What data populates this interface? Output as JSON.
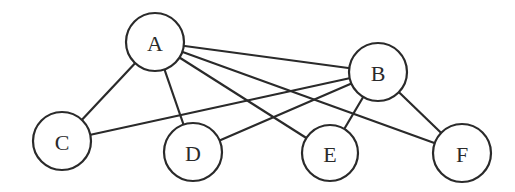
{
  "diagram": {
    "type": "bipartite-graph",
    "colors": {
      "stroke": "#2a2a2a",
      "fill": "#ffffff",
      "background": "#ffffff"
    },
    "nodes": [
      {
        "id": "A",
        "label": "A",
        "x": 155,
        "y": 42,
        "r": 29
      },
      {
        "id": "B",
        "label": "B",
        "x": 378,
        "y": 72,
        "r": 29
      },
      {
        "id": "C",
        "label": "C",
        "x": 62,
        "y": 141,
        "r": 29
      },
      {
        "id": "D",
        "label": "D",
        "x": 193,
        "y": 152,
        "r": 29
      },
      {
        "id": "E",
        "label": "E",
        "x": 330,
        "y": 153,
        "r": 28
      },
      {
        "id": "F",
        "label": "F",
        "x": 462,
        "y": 153,
        "r": 29
      }
    ],
    "edges": [
      {
        "from": "A",
        "to": "B"
      },
      {
        "from": "A",
        "to": "C"
      },
      {
        "from": "A",
        "to": "D"
      },
      {
        "from": "A",
        "to": "E"
      },
      {
        "from": "A",
        "to": "F"
      },
      {
        "from": "B",
        "to": "C"
      },
      {
        "from": "B",
        "to": "D"
      },
      {
        "from": "B",
        "to": "E"
      },
      {
        "from": "B",
        "to": "F"
      }
    ]
  }
}
